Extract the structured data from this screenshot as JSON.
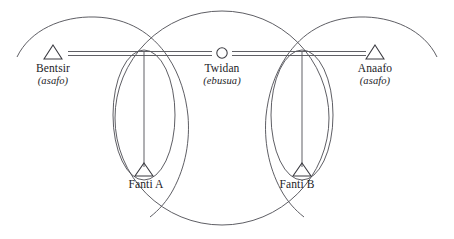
{
  "diagram": {
    "colors": {
      "background": "#ffffff",
      "curve": "#4c4c52",
      "node": "#3a3a40",
      "link": "#57575d",
      "text": "#1c1c1f"
    },
    "nodes": [
      {
        "id": "bentsir",
        "label": "Bentsir",
        "sublabel": "(asafo)",
        "shape": "triangle",
        "x": 53,
        "y": 55,
        "label_x": 53,
        "label_y": 62
      },
      {
        "id": "twidan",
        "label": "Twidan",
        "sublabel": "(ebusua)",
        "shape": "circle",
        "x": 222,
        "y": 54,
        "label_x": 222,
        "label_y": 62
      },
      {
        "id": "anaafo",
        "label": "Anaafo",
        "sublabel": "(asafo)",
        "shape": "triangle",
        "x": 375,
        "y": 55,
        "label_x": 375,
        "label_y": 62
      },
      {
        "id": "fanti-a",
        "label": "Fanti A",
        "sublabel": "",
        "shape": "triangle",
        "x": 144,
        "y": 172,
        "label_x": 146,
        "label_y": 178
      },
      {
        "id": "fanti-b",
        "label": "Fanti B",
        "sublabel": "",
        "shape": "triangle",
        "x": 302,
        "y": 172,
        "label_x": 297,
        "label_y": 178
      }
    ],
    "links": [
      {
        "id": "bentsir-to-crossing-left",
        "style": "double-horizontal"
      },
      {
        "id": "crossing-left-to-twidan",
        "style": "double-horizontal"
      },
      {
        "id": "twidan-to-crossing-right",
        "style": "double-horizontal"
      },
      {
        "id": "crossing-right-to-anaafo",
        "style": "double-horizontal"
      },
      {
        "id": "crossing-left-to-fanti-a",
        "style": "single-vertical"
      },
      {
        "id": "crossing-right-to-fanti-b",
        "style": "single-vertical"
      }
    ],
    "curves": [
      {
        "id": "outer-arc-left",
        "shape": "arc"
      },
      {
        "id": "outer-arc-right",
        "shape": "arc"
      },
      {
        "id": "central-circle",
        "shape": "circle"
      },
      {
        "id": "ellipse-fanti-a",
        "shape": "ellipse"
      },
      {
        "id": "ellipse-fanti-b",
        "shape": "ellipse"
      }
    ]
  }
}
